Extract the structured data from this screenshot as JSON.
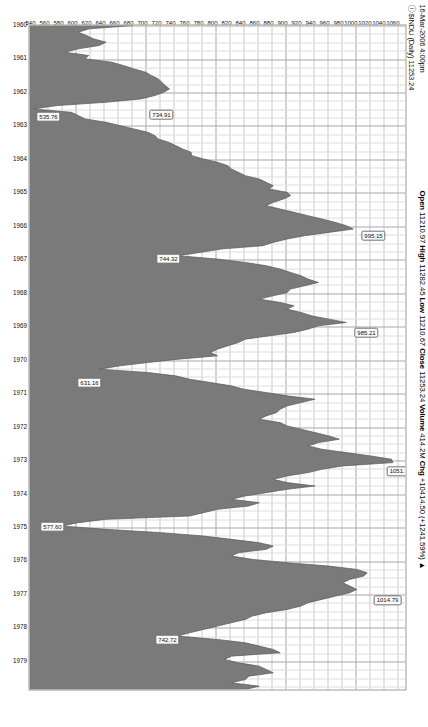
{
  "header": {
    "timestamp": "16-Mar-2006 4:00pm",
    "symbol_line": "$INDU (Daily) 11253.24",
    "symbol_prefix": "ⓘ",
    "open_label": "Open",
    "open_value": "11210.97",
    "high_label": "High",
    "high_value": "11282.45",
    "low_label": "Low",
    "low_value": "11210.67",
    "close_label": "Close",
    "close_value": "11253.24",
    "volume_label": "Volume",
    "volume_value": "414.2M",
    "chg_label": "Chg",
    "chg_value": "+10414.50 (+1241.59%)",
    "chg_arrow": "▲"
  },
  "chart_data": {
    "type": "area",
    "title": "$INDU (Daily) 11253.24",
    "xlabel": "",
    "ylabel": "",
    "grid": true,
    "legend": "none",
    "xlim": [
      1960.0,
      1979.9
    ],
    "ylim": [
      530,
      1070
    ],
    "x_tick_labels": [
      "1960",
      "1961",
      "1962",
      "1963",
      "1964",
      "1965",
      "1966",
      "1967",
      "1968",
      "1969",
      "1970",
      "1971",
      "1972",
      "1973",
      "1974",
      "1975",
      "1976",
      "1977",
      "1978",
      "1979"
    ],
    "y_tick_labels": [
      "1060",
      "1040",
      "1020",
      "1000",
      "980",
      "960",
      "940",
      "920",
      "900",
      "880",
      "860",
      "840",
      "820",
      "800",
      "780",
      "760",
      "740",
      "720",
      "700",
      "680",
      "660",
      "640",
      "620",
      "600",
      "580",
      "560",
      "540"
    ],
    "y_tick_values": [
      1060,
      1040,
      1020,
      1000,
      980,
      960,
      940,
      920,
      900,
      880,
      860,
      840,
      820,
      800,
      780,
      760,
      740,
      720,
      700,
      680,
      660,
      640,
      620,
      600,
      580,
      560,
      540
    ],
    "annotations": [
      {
        "label": "734.91",
        "x": 1962.45,
        "y": 735,
        "kind": "low"
      },
      {
        "label": "535.76",
        "x": 1962.5,
        "y": 536,
        "kind": "low"
      },
      {
        "label": "995.15",
        "x": 1966.08,
        "y": 995,
        "kind": "high"
      },
      {
        "label": "744.32",
        "x": 1966.75,
        "y": 744,
        "kind": "low"
      },
      {
        "label": "985.21",
        "x": 1968.95,
        "y": 985,
        "kind": "high"
      },
      {
        "label": "631.16",
        "x": 1970.45,
        "y": 631,
        "kind": "low"
      },
      {
        "label": "1051.70",
        "x": 1973.05,
        "y": 1052,
        "kind": "high"
      },
      {
        "label": "577.60",
        "x": 1974.75,
        "y": 578,
        "kind": "low"
      },
      {
        "label": "1014.79",
        "x": 1976.9,
        "y": 1015,
        "kind": "high"
      },
      {
        "label": "742.72",
        "x": 1978.15,
        "y": 743,
        "kind": "low"
      }
    ],
    "series": [
      {
        "name": "$INDU",
        "x": [
          1960.0,
          1960.1,
          1960.2,
          1960.3,
          1960.4,
          1960.5,
          1960.6,
          1960.7,
          1960.8,
          1960.9,
          1961.0,
          1961.1,
          1961.2,
          1961.3,
          1961.4,
          1961.5,
          1961.6,
          1961.7,
          1961.8,
          1961.9,
          1962.0,
          1962.1,
          1962.2,
          1962.3,
          1962.4,
          1962.5,
          1962.6,
          1962.7,
          1962.8,
          1962.9,
          1963.0,
          1963.1,
          1963.2,
          1963.3,
          1963.4,
          1963.5,
          1963.6,
          1963.7,
          1963.8,
          1963.9,
          1964.0,
          1964.1,
          1964.2,
          1964.3,
          1964.4,
          1964.5,
          1964.6,
          1964.7,
          1964.8,
          1964.9,
          1965.0,
          1965.1,
          1965.2,
          1965.3,
          1965.4,
          1965.5,
          1965.6,
          1965.7,
          1965.8,
          1965.9,
          1966.0,
          1966.1,
          1966.2,
          1966.3,
          1966.4,
          1966.5,
          1966.6,
          1966.7,
          1966.8,
          1966.9,
          1967.0,
          1967.1,
          1967.2,
          1967.3,
          1967.4,
          1967.5,
          1967.6,
          1967.7,
          1967.8,
          1967.9,
          1968.0,
          1968.1,
          1968.2,
          1968.3,
          1968.4,
          1968.5,
          1968.6,
          1968.7,
          1968.8,
          1968.9,
          1969.0,
          1969.1,
          1969.2,
          1969.3,
          1969.4,
          1969.5,
          1969.6,
          1969.7,
          1969.8,
          1969.9,
          1970.0,
          1970.1,
          1970.2,
          1970.3,
          1970.4,
          1970.5,
          1970.6,
          1970.7,
          1970.8,
          1970.9,
          1971.0,
          1971.1,
          1971.2,
          1971.3,
          1971.4,
          1971.5,
          1971.6,
          1971.7,
          1971.8,
          1971.9,
          1972.0,
          1972.1,
          1972.2,
          1972.3,
          1972.4,
          1972.5,
          1972.6,
          1972.7,
          1972.8,
          1972.9,
          1973.0,
          1973.1,
          1973.2,
          1973.3,
          1973.4,
          1973.5,
          1973.6,
          1973.7,
          1973.8,
          1973.9,
          1974.0,
          1974.1,
          1974.2,
          1974.3,
          1974.4,
          1974.5,
          1974.6,
          1974.7,
          1974.8,
          1974.9,
          1975.0,
          1975.1,
          1975.2,
          1975.3,
          1975.4,
          1975.5,
          1975.6,
          1975.7,
          1975.8,
          1975.9,
          1976.0,
          1976.1,
          1976.2,
          1976.3,
          1976.4,
          1976.5,
          1976.6,
          1976.7,
          1976.8,
          1976.9,
          1977.0,
          1977.1,
          1977.2,
          1977.3,
          1977.4,
          1977.5,
          1977.6,
          1977.7,
          1977.8,
          1977.9,
          1978.0,
          1978.1,
          1978.2,
          1978.3,
          1978.4,
          1978.5,
          1978.6,
          1978.7,
          1978.8,
          1978.9,
          1979.0,
          1979.1,
          1979.2,
          1979.3,
          1979.4,
          1979.5,
          1979.6,
          1979.7,
          1979.8,
          1979.9
        ],
        "values": [
          679,
          616,
          600,
          612,
          622,
          640,
          630,
          600,
          581,
          615,
          610,
          648,
          665,
          680,
          697,
          705,
          715,
          720,
          725,
          731,
          723,
          710,
          690,
          640,
          570,
          536,
          590,
          600,
          610,
          640,
          660,
          680,
          700,
          710,
          715,
          730,
          740,
          750,
          762,
          763,
          780,
          800,
          815,
          820,
          830,
          840,
          860,
          870,
          880,
          874,
          900,
          905,
          895,
          880,
          870,
          890,
          910,
          930,
          950,
          969,
          985,
          995,
          960,
          925,
          900,
          880,
          865,
          805,
          775,
          744,
          800,
          840,
          870,
          890,
          905,
          920,
          930,
          945,
          925,
          905,
          900,
          880,
          860,
          890,
          910,
          900,
          920,
          935,
          960,
          985,
          945,
          930,
          910,
          875,
          840,
          830,
          815,
          800,
          790,
          800,
          744,
          700,
          660,
          631,
          700,
          740,
          760,
          790,
          820,
          838,
          870,
          900,
          940,
          920,
          900,
          890,
          885,
          870,
          860,
          890,
          900,
          920,
          940,
          960,
          975,
          945,
          930,
          950,
          985,
          1020,
          1050,
          1052,
          980,
          950,
          930,
          900,
          880,
          900,
          940,
          900,
          870,
          840,
          820,
          860,
          845,
          800,
          780,
          760,
          640,
          600,
          577,
          640,
          720,
          780,
          820,
          860,
          880,
          870,
          830,
          820,
          850,
          900,
          960,
          1000,
          1015,
          1010,
          990,
          980,
          990,
          1000,
          990,
          970,
          950,
          930,
          920,
          900,
          870,
          850,
          840,
          820,
          800,
          780,
          760,
          743,
          800,
          840,
          860,
          880,
          890,
          820,
          810,
          830,
          860,
          870,
          880,
          845,
          840,
          820,
          860,
          840
        ]
      }
    ]
  },
  "colors": {
    "plot_fill": "#7a7a7a",
    "grid": "#c9c9c9",
    "frame": "#9a9a9a",
    "text": "#111111",
    "background": "#ffffff"
  }
}
